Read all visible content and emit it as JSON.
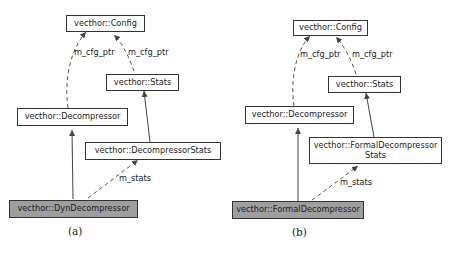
{
  "figures": [
    {
      "caption": "(a)",
      "nodes": {
        "config": "vecthor::Config",
        "stats": "vecthor::Stats",
        "decompressor": "vecthor::Decompressor",
        "decompressor_stats": "vecthor::DecompressorStats",
        "main": "vecthor::DynDecompressor"
      },
      "edges": {
        "cfg_ptr_left": "m_cfg_ptr",
        "cfg_ptr_right": "m_cfg_ptr",
        "stats": "m_stats"
      }
    },
    {
      "caption": "(b)",
      "nodes": {
        "config": "vecthor::Config",
        "stats": "vecthor::Stats",
        "decompressor": "vecthor::Decompressor",
        "decompressor_stats": "vecthor::FormalDecompressor Stats",
        "main": "vecthor::FormalDecompressor"
      },
      "edges": {
        "cfg_ptr_left": "m_cfg_ptr",
        "cfg_ptr_right": "m_cfg_ptr",
        "stats": "m_stats"
      }
    }
  ],
  "colors": {
    "highlight_node": "#9e9e9e",
    "edge": "#444444"
  }
}
